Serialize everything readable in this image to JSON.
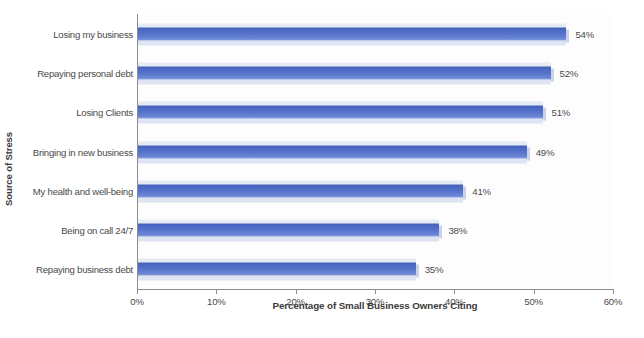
{
  "chart_data": {
    "type": "bar",
    "orientation": "horizontal",
    "title": "",
    "xlabel": "Percentage of Small Business Owners Citing",
    "ylabel": "Source of Stress",
    "categories": [
      "Losing my business",
      "Repaying personal debt",
      "Losing Clients",
      "Bringing in new business",
      "My health and well-being",
      "Being on call 24/7",
      "Repaying business debt"
    ],
    "values": [
      54,
      52,
      51,
      49,
      41,
      38,
      35
    ],
    "data_labels": [
      "54%",
      "52%",
      "51%",
      "49%",
      "41%",
      "38%",
      "35%"
    ],
    "xlim": [
      0,
      60
    ],
    "xticks": [
      0,
      10,
      20,
      30,
      40,
      50,
      60
    ],
    "xtick_labels": [
      "0%",
      "10%",
      "20%",
      "30%",
      "40%",
      "50%",
      "60%"
    ],
    "grid": false,
    "legend": false,
    "legend_position": "none",
    "bar_color": "#5472ca",
    "bar_shadow_color": "#dfe4f2",
    "axis_color": "#8d8d8d",
    "text_color": "#4a4a4a",
    "background_color": "#ffffff"
  }
}
